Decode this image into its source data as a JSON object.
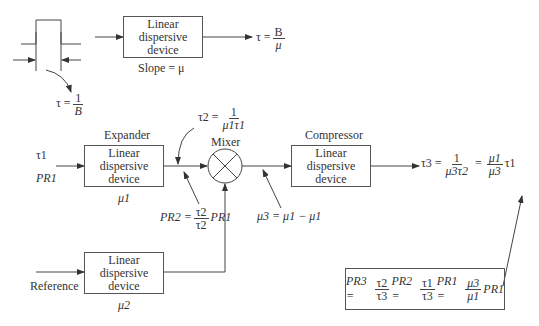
{
  "diagram": {
    "top": {
      "box_label": [
        "Linear",
        "dispersive",
        "device"
      ],
      "slope_label": "Slope = μ",
      "output_eq": {
        "lhs": "τ =",
        "num": "B",
        "den": "μ"
      },
      "pulse_width_eq": {
        "lhs": "τ =",
        "num": "1",
        "den": "B"
      }
    },
    "expander": {
      "title": "Expander",
      "box_label": [
        "Linear",
        "dispersive",
        "device"
      ],
      "param": "μ1",
      "input_tau": "τ1",
      "input_power": "PR1"
    },
    "mixer": {
      "title": "Mixer"
    },
    "compressor": {
      "title": "Compressor",
      "box_label": [
        "Linear",
        "dispersive",
        "device"
      ]
    },
    "reference": {
      "label": "Reference",
      "box_label": [
        "Linear",
        "dispersive",
        "device"
      ],
      "param": "μ2"
    },
    "annotations": {
      "tau2": {
        "lhs": "τ2 =",
        "num": "1",
        "den": "μ1τ1"
      },
      "pr2": {
        "lhs": "PR2 =",
        "num": "τ2",
        "den": "τ2",
        "rhs": "PR1"
      },
      "mu3": "μ3 = μ1 − μ1",
      "tau3": {
        "lhs": "τ3 =",
        "num1": "1",
        "den1": "μ3τ2",
        "num2": "μ1",
        "den2": "μ3",
        "rhs": "τ1"
      },
      "pr3": {
        "lhs": "PR3 =",
        "f1n": "τ2",
        "f1d": "τ3",
        "t1": "PR2 =",
        "f2n": "τ1",
        "f2d": "τ3",
        "t2": "PR1 =",
        "f3n": "μ3",
        "f3d": "μ1",
        "t3": "PR1"
      }
    }
  }
}
